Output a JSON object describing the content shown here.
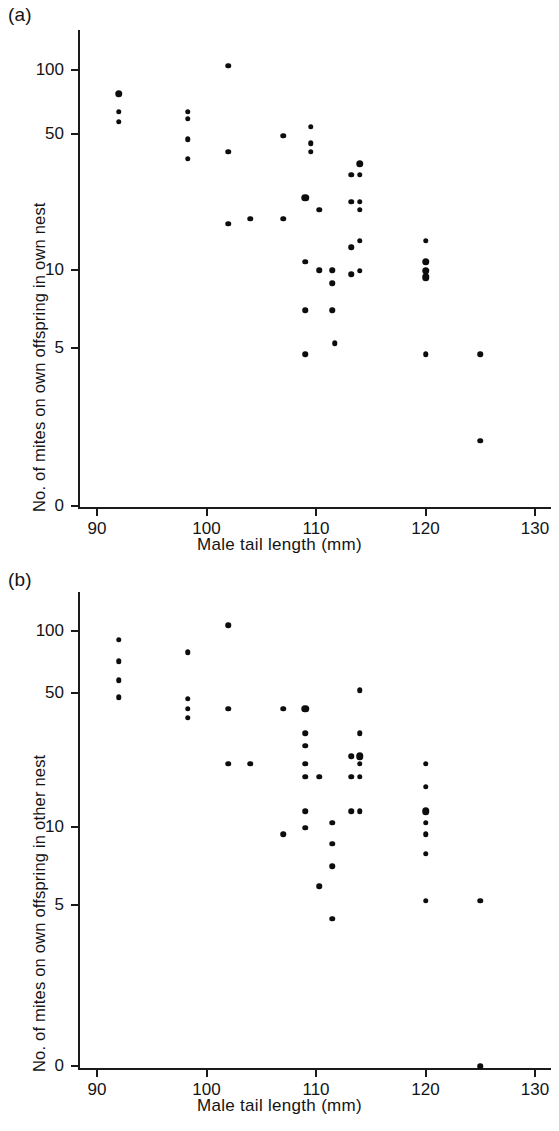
{
  "figure": {
    "width": 559,
    "height": 1131,
    "background": "#ffffff",
    "ink_color": "#0d0d0d"
  },
  "panels": [
    {
      "id": "a",
      "label": "(a)",
      "xlabel": "Male tail length (mm)",
      "ylabel": "No. of mites on own offspring in own nest"
    },
    {
      "id": "b",
      "label": "(b)",
      "xlabel": "Male tail length (mm)",
      "ylabel": "No. of mites on own offspring in other nest"
    }
  ],
  "chart_data": [
    {
      "type": "scatter",
      "panel": "a",
      "title": "(a)",
      "xlabel": "Male tail length (mm)",
      "ylabel": "No. of mites on own offspring in own nest",
      "xlim": [
        87,
        133
      ],
      "xticks": [
        90,
        100,
        110,
        120,
        130
      ],
      "xtick_labels": [
        "90",
        "100",
        "110",
        "120",
        "130"
      ],
      "yscale": "log-with-zero-break",
      "yticks": [
        100,
        50,
        10,
        5,
        0
      ],
      "ytick_labels": [
        "100",
        "50",
        "10",
        "5",
        "0"
      ],
      "grid": false,
      "legend": null,
      "marker": "filled-circle",
      "points": [
        {
          "x": 92,
          "y": 76,
          "size": "large"
        },
        {
          "x": 92,
          "y": 62,
          "size": "small"
        },
        {
          "x": 92,
          "y": 55,
          "size": "small"
        },
        {
          "x": 98.3,
          "y": 62,
          "size": "small"
        },
        {
          "x": 98.3,
          "y": 57,
          "size": "small"
        },
        {
          "x": 98.3,
          "y": 45,
          "size": "small"
        },
        {
          "x": 98.3,
          "y": 36,
          "size": "small"
        },
        {
          "x": 102,
          "y": 105,
          "size": "small"
        },
        {
          "x": 102,
          "y": 39,
          "size": "small"
        },
        {
          "x": 102,
          "y": 17,
          "size": "small"
        },
        {
          "x": 104,
          "y": 18,
          "size": "small"
        },
        {
          "x": 107,
          "y": 47,
          "size": "small"
        },
        {
          "x": 107,
          "y": 18,
          "size": "small"
        },
        {
          "x": 109,
          "y": 23,
          "size": "large"
        },
        {
          "x": 109,
          "y": 11,
          "size": "small"
        },
        {
          "x": 109,
          "y": 6.3,
          "size": "small"
        },
        {
          "x": 109,
          "y": 3.8,
          "size": "small"
        },
        {
          "x": 109.5,
          "y": 52,
          "size": "small"
        },
        {
          "x": 109.5,
          "y": 43,
          "size": "small"
        },
        {
          "x": 109.5,
          "y": 39,
          "size": "small"
        },
        {
          "x": 110.3,
          "y": 20,
          "size": "small"
        },
        {
          "x": 110.3,
          "y": 10,
          "size": "small"
        },
        {
          "x": 111.5,
          "y": 10,
          "size": "small"
        },
        {
          "x": 111.5,
          "y": 8.6,
          "size": "small"
        },
        {
          "x": 111.5,
          "y": 6.3,
          "size": "small"
        },
        {
          "x": 111.7,
          "y": 4.3,
          "size": "small"
        },
        {
          "x": 113.2,
          "y": 30,
          "size": "small"
        },
        {
          "x": 113.2,
          "y": 22,
          "size": "small"
        },
        {
          "x": 113.2,
          "y": 13,
          "size": "small"
        },
        {
          "x": 113.2,
          "y": 9.5,
          "size": "small"
        },
        {
          "x": 114,
          "y": 34,
          "size": "large"
        },
        {
          "x": 114,
          "y": 30,
          "size": "small"
        },
        {
          "x": 114,
          "y": 22,
          "size": "small"
        },
        {
          "x": 114,
          "y": 20,
          "size": "small"
        },
        {
          "x": 114,
          "y": 14,
          "size": "small"
        },
        {
          "x": 114,
          "y": 9.9,
          "size": "small"
        },
        {
          "x": 120,
          "y": 14,
          "size": "small"
        },
        {
          "x": 120,
          "y": 11,
          "size": "large"
        },
        {
          "x": 120,
          "y": 9.9,
          "size": "large"
        },
        {
          "x": 120,
          "y": 9.2,
          "size": "large"
        },
        {
          "x": 120,
          "y": 3.8,
          "size": "small"
        },
        {
          "x": 125,
          "y": 3.8,
          "size": "small"
        },
        {
          "x": 125,
          "y": 1.4,
          "size": "small"
        }
      ]
    },
    {
      "type": "scatter",
      "panel": "b",
      "title": "(b)",
      "xlabel": "Male tail length (mm)",
      "ylabel": "No. of mites on own offspring in other nest",
      "xlim": [
        87,
        133
      ],
      "xticks": [
        90,
        100,
        110,
        120,
        130
      ],
      "xtick_labels": [
        "90",
        "100",
        "110",
        "120",
        "130"
      ],
      "yscale": "log-with-zero-break",
      "yticks": [
        100,
        50,
        10,
        5,
        0
      ],
      "ytick_labels": [
        "100",
        "50",
        "10",
        "5",
        "0"
      ],
      "grid": false,
      "legend": null,
      "marker": "filled-circle",
      "points": [
        {
          "x": 92,
          "y": 90,
          "size": "small"
        },
        {
          "x": 92,
          "y": 70,
          "size": "small"
        },
        {
          "x": 92,
          "y": 56,
          "size": "small"
        },
        {
          "x": 92,
          "y": 46,
          "size": "small"
        },
        {
          "x": 98.3,
          "y": 78,
          "size": "small"
        },
        {
          "x": 98.3,
          "y": 45,
          "size": "small"
        },
        {
          "x": 98.3,
          "y": 40,
          "size": "small"
        },
        {
          "x": 98.3,
          "y": 36,
          "size": "small"
        },
        {
          "x": 102,
          "y": 107,
          "size": "small"
        },
        {
          "x": 102,
          "y": 40,
          "size": "small"
        },
        {
          "x": 102,
          "y": 21,
          "size": "small"
        },
        {
          "x": 104,
          "y": 21,
          "size": "small"
        },
        {
          "x": 107,
          "y": 40,
          "size": "small"
        },
        {
          "x": 107,
          "y": 9.2,
          "size": "small"
        },
        {
          "x": 109,
          "y": 40,
          "size": "large"
        },
        {
          "x": 109,
          "y": 30,
          "size": "small"
        },
        {
          "x": 109,
          "y": 26,
          "size": "small"
        },
        {
          "x": 109,
          "y": 21,
          "size": "small"
        },
        {
          "x": 109,
          "y": 18,
          "size": "small"
        },
        {
          "x": 109,
          "y": 12,
          "size": "small"
        },
        {
          "x": 109,
          "y": 9.9,
          "size": "small"
        },
        {
          "x": 110.3,
          "y": 18,
          "size": "small"
        },
        {
          "x": 110.3,
          "y": 5.0,
          "size": "small"
        },
        {
          "x": 111.5,
          "y": 10.5,
          "size": "small"
        },
        {
          "x": 111.5,
          "y": 8.2,
          "size": "small"
        },
        {
          "x": 111.5,
          "y": 6.3,
          "size": "small"
        },
        {
          "x": 111.5,
          "y": 3.4,
          "size": "small"
        },
        {
          "x": 113.2,
          "y": 23,
          "size": "small"
        },
        {
          "x": 113.2,
          "y": 18,
          "size": "small"
        },
        {
          "x": 113.2,
          "y": 12,
          "size": "small"
        },
        {
          "x": 114,
          "y": 50,
          "size": "small"
        },
        {
          "x": 114,
          "y": 30,
          "size": "small"
        },
        {
          "x": 114,
          "y": 23,
          "size": "large"
        },
        {
          "x": 114,
          "y": 21,
          "size": "small"
        },
        {
          "x": 114,
          "y": 18,
          "size": "small"
        },
        {
          "x": 114,
          "y": 12,
          "size": "small"
        },
        {
          "x": 120,
          "y": 21,
          "size": "small"
        },
        {
          "x": 120,
          "y": 16,
          "size": "small"
        },
        {
          "x": 120,
          "y": 12,
          "size": "large"
        },
        {
          "x": 120,
          "y": 10.5,
          "size": "small"
        },
        {
          "x": 120,
          "y": 9.2,
          "size": "small"
        },
        {
          "x": 120,
          "y": 7.3,
          "size": "small"
        },
        {
          "x": 120,
          "y": 4.2,
          "size": "small"
        },
        {
          "x": 125,
          "y": 4.2,
          "size": "small"
        },
        {
          "x": 125,
          "y": 0.0,
          "size": "small"
        }
      ]
    }
  ]
}
